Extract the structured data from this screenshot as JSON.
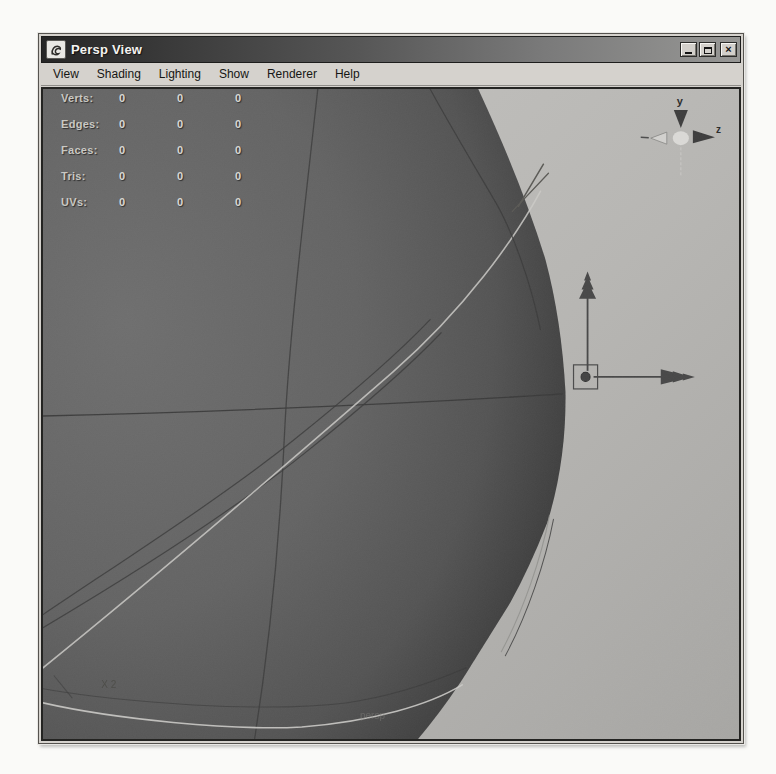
{
  "window": {
    "title": "Persp View",
    "app_icon": "maya-logo-icon",
    "buttons": [
      {
        "name": "minimize"
      },
      {
        "name": "maximize"
      },
      {
        "name": "close",
        "glyph": "×"
      }
    ]
  },
  "menu": {
    "items": [
      {
        "label": "View"
      },
      {
        "label": "Shading"
      },
      {
        "label": "Lighting"
      },
      {
        "label": "Show"
      },
      {
        "label": "Renderer"
      },
      {
        "label": "Help"
      }
    ]
  },
  "hud": {
    "rows": [
      {
        "label": "Verts:",
        "values": [
          "0",
          "0",
          "0"
        ]
      },
      {
        "label": "Edges:",
        "values": [
          "0",
          "0",
          "0"
        ]
      },
      {
        "label": "Faces:",
        "values": [
          "0",
          "0",
          "0"
        ]
      },
      {
        "label": "Tris:",
        "values": [
          "0",
          "0",
          "0"
        ]
      },
      {
        "label": "UVs:",
        "values": [
          "0",
          "0",
          "0"
        ]
      }
    ]
  },
  "viewport": {
    "camera_label": "persp",
    "annotation_label": "X 2",
    "axis_gizmo": {
      "y_label": "y",
      "z_label": "z"
    }
  },
  "colors": {
    "chrome": "#d5d2cd",
    "titlebar_left": "#262626",
    "titlebar_right": "#979795",
    "viewport_background_light": "#c6c5c2",
    "viewport_background_dark": "#a7a6a3",
    "sphere_fill": "#646464",
    "sphere_edge_shadow": "#2c2c2c",
    "wireframe_dark": "#3c3c3c",
    "wireframe_light": "#cbcac7",
    "manipulator": "#4a4a4a",
    "hud_text": "#d9d8d4"
  }
}
